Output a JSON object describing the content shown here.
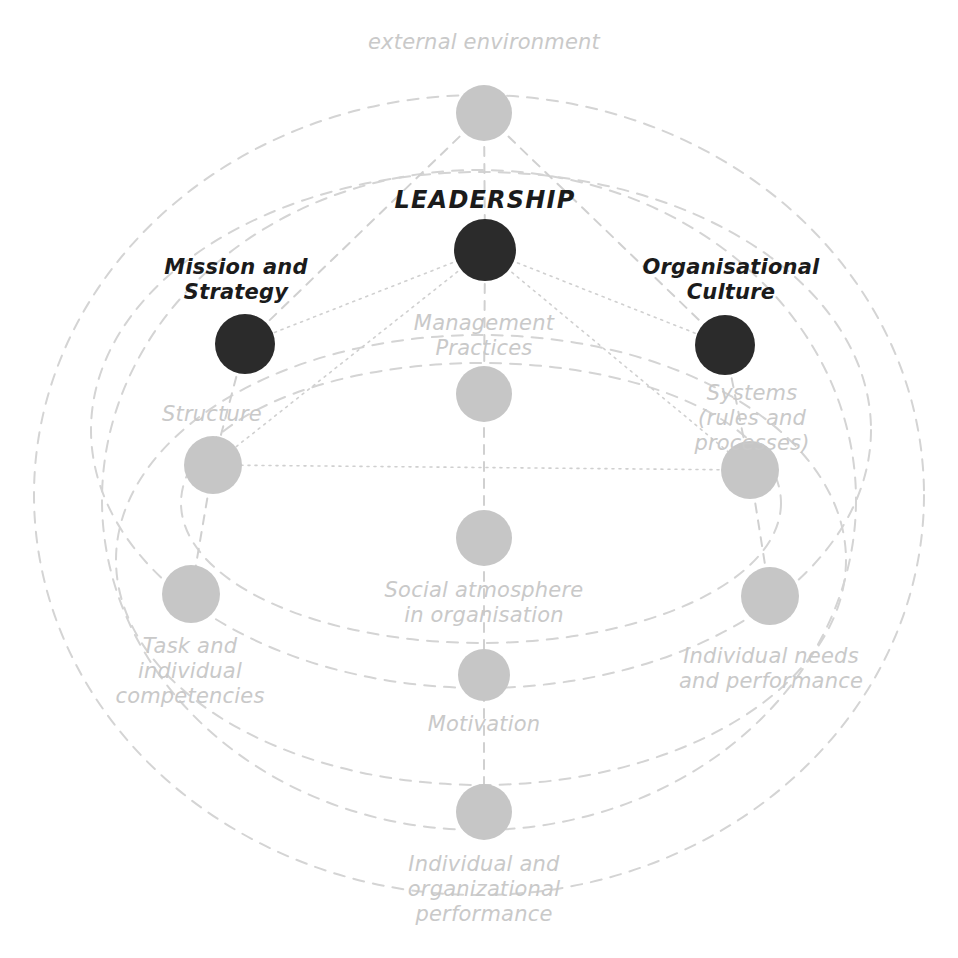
{
  "diagram": {
    "background_color": "#ffffff",
    "colors": {
      "node_dark": "#2b2b2b",
      "node_light": "#c6c6c6",
      "label_dark": "#1b1b1b",
      "label_light": "#c9c9c9",
      "ellipse_line": "#d4d4d4",
      "connector_line": "#d0d0d0"
    },
    "nodes": [
      {
        "id": "external-environment",
        "label": "external environment",
        "emphasis": "light",
        "cx": 484,
        "cy": 113,
        "r": 28,
        "label_x": 484,
        "label_y": 30,
        "label_align": "above"
      },
      {
        "id": "leadership",
        "label": "LEADERSHIP",
        "emphasis": "dark",
        "cx": 485,
        "cy": 250,
        "r": 31,
        "label_x": 485,
        "label_y": 186,
        "label_align": "above"
      },
      {
        "id": "mission-and-strategy",
        "label": "Mission and\nStrategy",
        "emphasis": "dark",
        "cx": 245,
        "cy": 344,
        "r": 30,
        "label_x": 236,
        "label_y": 255,
        "label_align": "above"
      },
      {
        "id": "organisational-culture",
        "label": "Organisational\nCulture",
        "emphasis": "dark",
        "cx": 725,
        "cy": 345,
        "r": 30,
        "label_x": 731,
        "label_y": 255,
        "label_align": "above"
      },
      {
        "id": "management-practices",
        "label": "Management\nPractices",
        "emphasis": "light",
        "cx": 484,
        "cy": 394,
        "r": 28,
        "label_x": 484,
        "label_y": 311,
        "label_align": "above"
      },
      {
        "id": "structure",
        "label": "Structure",
        "emphasis": "light",
        "cx": 213,
        "cy": 465,
        "r": 29,
        "label_x": 212,
        "label_y": 402,
        "label_align": "above"
      },
      {
        "id": "systems",
        "label": "Systems\n(rules and processes)",
        "emphasis": "light",
        "cx": 750,
        "cy": 470,
        "r": 29,
        "label_x": 752,
        "label_y": 381,
        "label_align": "above"
      },
      {
        "id": "social-atmosphere",
        "label": "Social atmosphere\nin organisation",
        "emphasis": "light",
        "cx": 484,
        "cy": 538,
        "r": 28,
        "label_x": 484,
        "label_y": 578,
        "label_align": "below"
      },
      {
        "id": "task-and-individual-competencies",
        "label": "Task and\nindividual\ncompetencies",
        "emphasis": "light",
        "cx": 191,
        "cy": 594,
        "r": 29,
        "label_x": 190,
        "label_y": 634,
        "label_align": "below"
      },
      {
        "id": "individual-needs-and-performance",
        "label": "Individual needs\nand performance",
        "emphasis": "light",
        "cx": 770,
        "cy": 596,
        "r": 29,
        "label_x": 771,
        "label_y": 644,
        "label_align": "below"
      },
      {
        "id": "motivation",
        "label": "Motivation",
        "emphasis": "light",
        "cx": 484,
        "cy": 675,
        "r": 26,
        "label_x": 484,
        "label_y": 712,
        "label_align": "below"
      },
      {
        "id": "individual-and-organizational-performance",
        "label": "Individual and\norganizational\nperformance",
        "emphasis": "light",
        "cx": 484,
        "cy": 812,
        "r": 28,
        "label_x": 484,
        "label_y": 852,
        "label_align": "below"
      }
    ],
    "ellipses": [
      {
        "id": "outer-boundary-ellipse",
        "cx": 479,
        "cy": 495,
        "rx": 445,
        "ry": 400,
        "rotation": 0
      },
      {
        "id": "inner-boundary-ellipse",
        "cx": 479,
        "cy": 500,
        "rx": 377,
        "ry": 330,
        "rotation": 0
      },
      {
        "id": "upper-band-ellipse",
        "cx": 481,
        "cy": 430,
        "rx": 390,
        "ry": 258,
        "rotation": 0
      },
      {
        "id": "mid-band-ellipse",
        "cx": 481,
        "cy": 503,
        "rx": 300,
        "ry": 140,
        "rotation": 0
      },
      {
        "id": "lower-band-ellipse",
        "cx": 481,
        "cy": 560,
        "rx": 365,
        "ry": 225,
        "rotation": 0
      }
    ],
    "connectors": [
      {
        "id": "leadership-to-mission",
        "from": "leadership",
        "to": "mission-and-strategy",
        "style": "dotted"
      },
      {
        "id": "leadership-to-culture",
        "from": "leadership",
        "to": "organisational-culture",
        "style": "dotted"
      },
      {
        "id": "leadership-to-management-practices",
        "from": "leadership",
        "to": "management-practices",
        "style": "dashed"
      },
      {
        "id": "leadership-to-structure",
        "from": "leadership",
        "to": "structure",
        "style": "dotted"
      },
      {
        "id": "leadership-to-systems",
        "from": "leadership",
        "to": "systems",
        "style": "dotted"
      },
      {
        "id": "external-to-leadership",
        "from": "external-environment",
        "to": "leadership",
        "style": "dashed"
      },
      {
        "id": "external-to-mission",
        "from": "external-environment",
        "to": "mission-and-strategy",
        "style": "dashed"
      },
      {
        "id": "external-to-culture",
        "from": "external-environment",
        "to": "organisational-culture",
        "style": "dashed"
      },
      {
        "id": "mission-to-structure",
        "from": "mission-and-strategy",
        "to": "structure",
        "style": "dashed"
      },
      {
        "id": "culture-to-systems",
        "from": "organisational-culture",
        "to": "systems",
        "style": "dashed"
      },
      {
        "id": "structure-to-systems",
        "from": "structure",
        "to": "systems",
        "style": "dotted"
      },
      {
        "id": "structure-to-task",
        "from": "structure",
        "to": "task-and-individual-competencies",
        "style": "dashed"
      },
      {
        "id": "systems-to-individual-needs",
        "from": "systems",
        "to": "individual-needs-and-performance",
        "style": "dashed"
      },
      {
        "id": "management-practices-to-social",
        "from": "management-practices",
        "to": "social-atmosphere",
        "style": "dashed"
      },
      {
        "id": "social-to-motivation",
        "from": "social-atmosphere",
        "to": "motivation",
        "style": "dashed"
      },
      {
        "id": "motivation-to-performance",
        "from": "motivation",
        "to": "individual-and-organizational-performance",
        "style": "dashed"
      }
    ]
  }
}
